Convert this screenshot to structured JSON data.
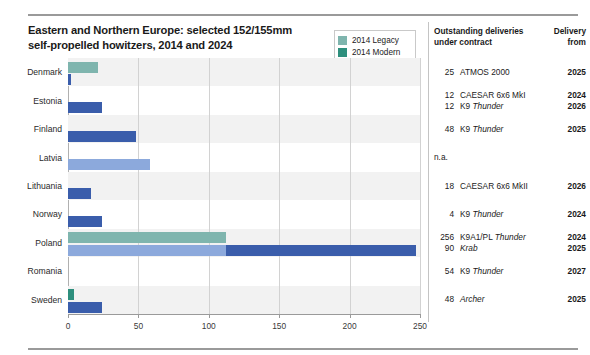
{
  "title": {
    "line1": "Eastern and Northern Europe: selected 152/155mm",
    "line2": "self-propelled howitzers, 2014 and 2024"
  },
  "legend": {
    "items": [
      {
        "label": "2014 Legacy",
        "color": "#7fb5ae"
      },
      {
        "label": "2014 Modern",
        "color": "#2e8f7d"
      },
      {
        "label": "2024 Legacy",
        "color": "#8ca9dc"
      },
      {
        "label": "2024 Modern",
        "color": "#3a5dab"
      }
    ]
  },
  "table": {
    "header_col1_line1": "Outstanding deliveries",
    "header_col1_line2": "under contract",
    "header_col2_line1": "Delivery",
    "header_col2_line2": "from",
    "rows": [
      {
        "country": "Denmark",
        "entries": [
          {
            "qty": "25",
            "system": "ATMOS 2000",
            "italic": "",
            "year": "2025"
          }
        ]
      },
      {
        "country": "Estonia",
        "entries": [
          {
            "qty": "12",
            "system": "CAESAR 6x6 MkI",
            "italic": "",
            "year": "2024"
          },
          {
            "qty": "12",
            "system": "K9 ",
            "italic": "Thunder",
            "year": "2026"
          }
        ]
      },
      {
        "country": "Finland",
        "entries": [
          {
            "qty": "48",
            "system": "K9 ",
            "italic": "Thunder",
            "year": "2025"
          }
        ]
      },
      {
        "country": "Latvia",
        "entries": [],
        "na": "n.a."
      },
      {
        "country": "Lithuania",
        "entries": [
          {
            "qty": "18",
            "system": "CAESAR 6x6 MkII",
            "italic": "",
            "year": "2026"
          }
        ]
      },
      {
        "country": "Norway",
        "entries": [
          {
            "qty": "4",
            "system": "K9 ",
            "italic": "Thunder",
            "year": "2024"
          }
        ]
      },
      {
        "country": "Poland",
        "entries": [
          {
            "qty": "256",
            "system": "K9A1/PL ",
            "italic": "Thunder",
            "year": "2024"
          },
          {
            "qty": "90",
            "system": "",
            "italic": "Krab",
            "year": "2025"
          }
        ]
      },
      {
        "country": "Romania",
        "entries": [
          {
            "qty": "54",
            "system": "K9 ",
            "italic": "Thunder",
            "year": "2027"
          }
        ]
      },
      {
        "country": "Sweden",
        "entries": [
          {
            "qty": "48",
            "system": "",
            "italic": "Archer",
            "year": "2025"
          }
        ]
      }
    ]
  },
  "chart_data": {
    "type": "bar",
    "orientation": "horizontal",
    "title": "Eastern and Northern Europe: selected 152/155mm self-propelled howitzers, 2014 and 2024",
    "xlabel": "",
    "ylabel": "",
    "xlim": [
      0,
      250
    ],
    "xticks": [
      0,
      50,
      100,
      150,
      200,
      250
    ],
    "grid": true,
    "legend_position": "top-right",
    "categories": [
      "Denmark",
      "Estonia",
      "Finland",
      "Latvia",
      "Lithuania",
      "Norway",
      "Poland",
      "Romania",
      "Sweden"
    ],
    "series": [
      {
        "name": "2014 Legacy",
        "color": "#7fb5ae",
        "year": 2014,
        "values": [
          21,
          0,
          0,
          0,
          0,
          0,
          112,
          0,
          0
        ]
      },
      {
        "name": "2014 Modern",
        "color": "#2e8f7d",
        "year": 2014,
        "values": [
          0,
          0,
          0,
          0,
          0,
          0,
          0,
          0,
          4
        ]
      },
      {
        "name": "2024 Legacy",
        "color": "#8ca9dc",
        "year": 2024,
        "values": [
          0,
          0,
          0,
          58,
          0,
          0,
          112,
          0,
          0
        ]
      },
      {
        "name": "2024 Modern",
        "color": "#3a5dab",
        "year": 2024,
        "values": [
          2,
          24,
          48,
          0,
          16,
          24,
          135,
          0,
          24
        ]
      }
    ]
  }
}
